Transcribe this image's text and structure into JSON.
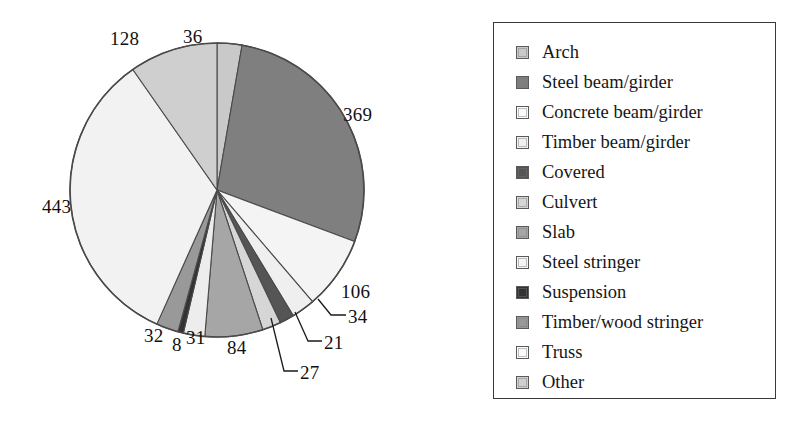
{
  "chart_data": {
    "type": "pie",
    "title": "",
    "total": 1319,
    "start_angle_deg": 0,
    "direction": "clockwise",
    "legend_position": "right",
    "grid": false,
    "categories": [
      "Arch",
      "Steel beam/girder",
      "Concrete beam/girder",
      "Timber beam/girder",
      "Covered",
      "Culvert",
      "Slab",
      "Steel stringer",
      "Suspension",
      "Timber/wood stringer",
      "Truss",
      "Other"
    ],
    "values": [
      36,
      369,
      106,
      34,
      21,
      27,
      84,
      443,
      8,
      32,
      31,
      128
    ],
    "slice_order_clockwise": [
      {
        "label": "Arch",
        "value": 36,
        "color": "#c9c9c9"
      },
      {
        "label": "Steel beam/girder",
        "value": 369,
        "color": "#7f7f7f"
      },
      {
        "label": "Concrete beam/girder",
        "value": 106,
        "color": "#f4f4f4"
      },
      {
        "label": "Timber beam/girder",
        "value": 34,
        "color": "#efefef"
      },
      {
        "label": "Covered",
        "value": 21,
        "color": "#555555"
      },
      {
        "label": "Culvert",
        "value": 27,
        "color": "#d6d6d6"
      },
      {
        "label": "Slab",
        "value": 84,
        "color": "#a6a6a6"
      },
      {
        "label": "Truss",
        "value": 31,
        "color": "#ededed"
      },
      {
        "label": "Suspension",
        "value": 8,
        "color": "#333333"
      },
      {
        "label": "Timber/wood stringer",
        "value": 32,
        "color": "#999999"
      },
      {
        "label": "Steel stringer",
        "value": 443,
        "color": "#f2f2f2"
      },
      {
        "label": "Other",
        "value": 128,
        "color": "#cfcfcf"
      }
    ],
    "data_labels": [
      "36",
      "369",
      "106",
      "34",
      "21",
      "27",
      "84",
      "443",
      "8",
      "32",
      "31",
      "128"
    ]
  },
  "pie": {
    "labels": {
      "v36": "36",
      "v369": "369",
      "v106": "106",
      "v34": "34",
      "v21": "21",
      "v27": "27",
      "v84": "84",
      "v31": "31",
      "v8": "8",
      "v32": "32",
      "v443": "443",
      "v128": "128"
    }
  },
  "legend": {
    "items": [
      {
        "label": "Arch",
        "color": "#c9c9c9"
      },
      {
        "label": "Steel beam/girder",
        "color": "#7f7f7f"
      },
      {
        "label": "Concrete beam/girder",
        "color": "#fbfbfb"
      },
      {
        "label": "Timber beam/girder",
        "color": "#f0f0f0"
      },
      {
        "label": "Covered",
        "color": "#555555"
      },
      {
        "label": "Culvert",
        "color": "#d6d6d6"
      },
      {
        "label": "Slab",
        "color": "#a6a6a6"
      },
      {
        "label": "Steel stringer",
        "color": "#f4f4f4"
      },
      {
        "label": "Suspension",
        "color": "#333333"
      },
      {
        "label": "Timber/wood stringer",
        "color": "#999999"
      },
      {
        "label": "Truss",
        "color": "#fbfbfb"
      },
      {
        "label": "Other",
        "color": "#cfcfcf"
      }
    ]
  }
}
